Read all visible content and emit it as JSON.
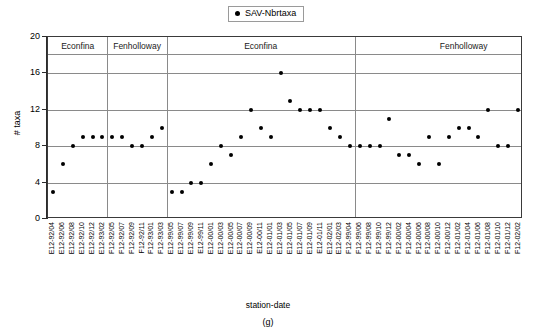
{
  "legend": {
    "label": "SAV-Nbrtaxa",
    "marker": "filled-circle",
    "color": "#000000"
  },
  "axes": {
    "ylabel": "# taxa",
    "xlabel": "station-date",
    "yticks": [
      0,
      4,
      8,
      12,
      16,
      20
    ],
    "ylim": [
      0,
      20
    ]
  },
  "figure_label": "(g)",
  "panels": [
    {
      "label": "Econfina",
      "start": 0,
      "end": 6
    },
    {
      "label": "Fenholloway",
      "start": 6,
      "end": 12
    },
    {
      "label": "Econfina",
      "start": 12,
      "end": 31
    },
    {
      "label": "Fenholloway",
      "start": 31,
      "end": 53
    }
  ],
  "chart_data": {
    "type": "scatter",
    "title": "",
    "xlabel": "station-date",
    "ylabel": "# taxa",
    "ylim": [
      0,
      20
    ],
    "yticks": [
      0,
      4,
      8,
      12,
      16,
      20
    ],
    "grid": "horizontal",
    "legend_position": "top-center",
    "series": [
      {
        "name": "SAV-Nbrtaxa",
        "color": "#000000",
        "marker": "circle",
        "categories": [
          "E12-92/04",
          "E12-92/06",
          "E12-92/08",
          "E12-92/10",
          "E12-92/12",
          "E12-93/02",
          "F12-92/05",
          "F12-92/07",
          "F12-92/09",
          "F12-92/11",
          "F12-93/01",
          "F12-93/03",
          "E12-99/05",
          "E12-99/07",
          "E12-99/09",
          "E12-99/11",
          "E12-00/01",
          "E12-00/03",
          "E12-00/05",
          "E12-00/07",
          "E12-00/09",
          "E12-00/11",
          "E12-01/01",
          "E12-01/03",
          "E12-01/05",
          "E12-01/07",
          "E12-01/09",
          "E12-01/11",
          "E12-02/01",
          "E12-02/03",
          "F12-99/04",
          "F12-99/06",
          "F12-99/08",
          "F12-99/10",
          "F12-99/12",
          "F12-00/02",
          "F12-00/04",
          "F12-00/06",
          "F12-00/08",
          "F12-00/10",
          "F12-00/12",
          "F12-01/02",
          "F12-01/04",
          "F12-01/06",
          "F12-01/08",
          "F12-01/10",
          "F12-01/12",
          "F12-02/02"
        ],
        "values": [
          3,
          6,
          8,
          9,
          9,
          9,
          9,
          9,
          8,
          8,
          9,
          10,
          3,
          3,
          4,
          4,
          6,
          8,
          7,
          9,
          12,
          10,
          9,
          16,
          13,
          12,
          12,
          12,
          10,
          9,
          8,
          8,
          8,
          8,
          11,
          7,
          7,
          6,
          9,
          6,
          9,
          10,
          10,
          9,
          12,
          8,
          8,
          12
        ]
      }
    ],
    "points": [
      {
        "panel": "Econfina",
        "station_date": "E12-92/04",
        "value": 3
      },
      {
        "panel": "Econfina",
        "station_date": "E12-92/06",
        "value": 6
      },
      {
        "panel": "Econfina",
        "station_date": "E12-92/08",
        "value": 8
      },
      {
        "panel": "Econfina",
        "station_date": "E12-92/10",
        "value": 9
      },
      {
        "panel": "Econfina",
        "station_date": "E12-92/12",
        "value": 9
      },
      {
        "panel": "Econfina",
        "station_date": "E12-93/02",
        "value": 9
      },
      {
        "panel": "Fenholloway",
        "station_date": "F12-92/05",
        "value": 3
      },
      {
        "panel": "Fenholloway",
        "station_date": "F12-92/07",
        "value": 3
      },
      {
        "panel": "Fenholloway",
        "station_date": "F12-92/09",
        "value": 4
      },
      {
        "panel": "Fenholloway",
        "station_date": "F12-92/11",
        "value": 4
      },
      {
        "panel": "Fenholloway",
        "station_date": "F12-93/01",
        "value": 6
      },
      {
        "panel": "Fenholloway",
        "station_date": "F12-93/03",
        "value": 8
      },
      {
        "panel": "Econfina",
        "station_date": "E12-99/05",
        "value": 12
      },
      {
        "panel": "Econfina",
        "station_date": "E12-99/07",
        "value": 16
      },
      {
        "panel": "Econfina",
        "station_date": "E12-99/09",
        "value": 13
      },
      {
        "panel": "Econfina",
        "station_date": "E12-99/11",
        "value": 12
      },
      {
        "panel": "Econfina",
        "station_date": "E12-00/01",
        "value": 12
      },
      {
        "panel": "Econfina",
        "station_date": "E12-00/03",
        "value": 12
      },
      {
        "panel": "Econfina",
        "station_date": "E12-00/05",
        "value": 9
      },
      {
        "panel": "Econfina",
        "station_date": "E12-00/07",
        "value": 8
      },
      {
        "panel": "Econfina",
        "station_date": "E12-00/09",
        "value": 8
      },
      {
        "panel": "Econfina",
        "station_date": "E12-00/11",
        "value": 8
      },
      {
        "panel": "Econfina",
        "station_date": "E12-01/01",
        "value": 8
      },
      {
        "panel": "Econfina",
        "station_date": "E12-01/03",
        "value": 7
      },
      {
        "panel": "Econfina",
        "station_date": "E12-01/05",
        "value": 7
      },
      {
        "panel": "Econfina",
        "station_date": "E12-01/07",
        "value": 10
      },
      {
        "panel": "Econfina",
        "station_date": "E12-01/09",
        "value": 8
      },
      {
        "panel": "Econfina",
        "station_date": "E12-01/11",
        "value": 6
      },
      {
        "panel": "Econfina",
        "station_date": "E12-02/01",
        "value": 6
      },
      {
        "panel": "Econfina",
        "station_date": "E12-02/03",
        "value": 9
      },
      {
        "panel": "Fenholloway",
        "station_date": "F12-99/04",
        "value": 9
      },
      {
        "panel": "Fenholloway",
        "station_date": "F12-99/06",
        "value": 9
      },
      {
        "panel": "Fenholloway",
        "station_date": "F12-99/08",
        "value": 7
      },
      {
        "panel": "Fenholloway",
        "station_date": "F12-99/10",
        "value": 11
      },
      {
        "panel": "Fenholloway",
        "station_date": "F12-99/12",
        "value": 9
      },
      {
        "panel": "Fenholloway",
        "station_date": "F12-00/02",
        "value": 8
      },
      {
        "panel": "Fenholloway",
        "station_date": "F12-00/04",
        "value": 6
      },
      {
        "panel": "Fenholloway",
        "station_date": "F12-00/06",
        "value": 12
      },
      {
        "panel": "Fenholloway",
        "station_date": "F12-00/08",
        "value": 10
      },
      {
        "panel": "Fenholloway",
        "station_date": "F12-00/10",
        "value": 10
      },
      {
        "panel": "Fenholloway",
        "station_date": "F12-00/12",
        "value": 8
      },
      {
        "panel": "Fenholloway",
        "station_date": "F12-01/02",
        "value": 8
      },
      {
        "panel": "Fenholloway",
        "station_date": "F12-01/04",
        "value": 13
      },
      {
        "panel": "Fenholloway",
        "station_date": "F12-01/06",
        "value": 10
      },
      {
        "panel": "Fenholloway",
        "station_date": "F12-01/08",
        "value": 10
      },
      {
        "panel": "Fenholloway",
        "station_date": "F12-01/10",
        "value": 6
      },
      {
        "panel": "Fenholloway",
        "station_date": "F12-01/12",
        "value": 6
      },
      {
        "panel": "Fenholloway",
        "station_date": "F12-02/02",
        "value": 12
      }
    ]
  },
  "plot_points": [
    {
      "i": 0,
      "v": 3
    },
    {
      "i": 1,
      "v": 6
    },
    {
      "i": 2,
      "v": 8
    },
    {
      "i": 3,
      "v": 9
    },
    {
      "i": 4,
      "v": 9
    },
    {
      "i": 5,
      "v": 9
    },
    {
      "i": 6,
      "v": 9
    },
    {
      "i": 7,
      "v": 9
    },
    {
      "i": 8,
      "v": 8
    },
    {
      "i": 9,
      "v": 8
    },
    {
      "i": 10,
      "v": 9
    },
    {
      "i": 11,
      "v": 10
    },
    {
      "i": 12,
      "v": 3
    },
    {
      "i": 13,
      "v": 3
    },
    {
      "i": 14,
      "v": 4
    },
    {
      "i": 15,
      "v": 4
    },
    {
      "i": 16,
      "v": 6
    },
    {
      "i": 17,
      "v": 8
    },
    {
      "i": 18,
      "v": 7
    },
    {
      "i": 19,
      "v": 9
    },
    {
      "i": 20,
      "v": 12
    },
    {
      "i": 21,
      "v": 10
    },
    {
      "i": 22,
      "v": 9
    },
    {
      "i": 23,
      "v": 16
    },
    {
      "i": 24,
      "v": 13
    },
    {
      "i": 25,
      "v": 12
    },
    {
      "i": 26,
      "v": 12
    },
    {
      "i": 27,
      "v": 12
    },
    {
      "i": 28,
      "v": 10
    },
    {
      "i": 29,
      "v": 9
    },
    {
      "i": 30,
      "v": 8
    },
    {
      "i": 31,
      "v": 8
    },
    {
      "i": 32,
      "v": 8
    },
    {
      "i": 33,
      "v": 8
    },
    {
      "i": 34,
      "v": 11
    },
    {
      "i": 35,
      "v": 7
    },
    {
      "i": 36,
      "v": 7
    },
    {
      "i": 37,
      "v": 6
    },
    {
      "i": 38,
      "v": 9
    },
    {
      "i": 39,
      "v": 6
    },
    {
      "i": 40,
      "v": 9
    },
    {
      "i": 41,
      "v": 10
    },
    {
      "i": 42,
      "v": 10
    },
    {
      "i": 43,
      "v": 9
    },
    {
      "i": 44,
      "v": 12
    },
    {
      "i": 45,
      "v": 8
    },
    {
      "i": 46,
      "v": 8
    },
    {
      "i": 47,
      "v": 12
    }
  ],
  "xtick_labels": [
    "E12-92/04",
    "E12-92/06",
    "E12-92/08",
    "E12-92/10",
    "E12-92/12",
    "E12-93/02",
    "F12-92/05",
    "F12-92/07",
    "F12-92/09",
    "F12-92/11",
    "F12-93/01",
    "F12-93/03",
    "E12-99/05",
    "E12-99/07",
    "E12-99/09",
    "E12-99/11",
    "E12-00/01",
    "E12-00/03",
    "E12-00/05",
    "E12-00/07",
    "E12-00/09",
    "E12-00/11",
    "E12-01/01",
    "E12-01/03",
    "E12-01/05",
    "E12-01/07",
    "E12-01/09",
    "E12-01/11",
    "E12-02/01",
    "E12-02/03",
    "F12-99/04",
    "F12-99/06",
    "F12-99/08",
    "F12-99/10",
    "F12-99/12",
    "F12-00/02",
    "F12-00/04",
    "F12-00/06",
    "F12-00/08",
    "F12-00/10",
    "F12-00/12",
    "F12-01/02",
    "F12-01/04",
    "F12-01/06",
    "F12-01/08",
    "F12-01/10",
    "F12-01/12",
    "F12-02/02"
  ],
  "panel_dividers": [
    6,
    12,
    31
  ]
}
